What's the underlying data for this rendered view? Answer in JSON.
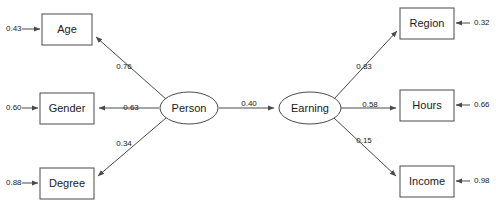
{
  "diagram": {
    "type": "structural-equation-model-path-diagram",
    "title": "",
    "background_color": "#ffffff",
    "line_color": "#4a4a4a",
    "text_color": "#1a1a1a",
    "latent_variables": [
      {
        "id": "person",
        "label": "Person",
        "shape": "ellipse",
        "cx": 189,
        "cy": 108,
        "rx": 29,
        "ry": 16
      },
      {
        "id": "earning",
        "label": "Earning",
        "shape": "ellipse",
        "cx": 310,
        "cy": 108,
        "rx": 31,
        "ry": 16
      }
    ],
    "observed_variables": [
      {
        "id": "age",
        "label": "Age",
        "shape": "rect",
        "x": 42,
        "y": 14,
        "w": 50,
        "h": 31,
        "residual": "0.43",
        "residual_x": 6,
        "residual_y": 29,
        "side": "left"
      },
      {
        "id": "gender",
        "label": "Gender",
        "shape": "rect",
        "x": 40,
        "y": 93,
        "w": 54,
        "h": 31,
        "residual": "0.60",
        "residual_x": 6,
        "residual_y": 108,
        "side": "left"
      },
      {
        "id": "degree",
        "label": "Degree",
        "shape": "rect",
        "x": 40,
        "y": 168,
        "w": 54,
        "h": 31,
        "residual": "0.88",
        "residual_x": 6,
        "residual_y": 183,
        "side": "left"
      },
      {
        "id": "region",
        "label": "Region",
        "shape": "rect",
        "x": 400,
        "y": 8,
        "w": 54,
        "h": 31,
        "residual": "0.32",
        "residual_x": 474,
        "residual_y": 23,
        "side": "right"
      },
      {
        "id": "hours",
        "label": "Hours",
        "shape": "rect",
        "x": 400,
        "y": 90,
        "w": 54,
        "h": 31,
        "residual": "0.66",
        "residual_x": 474,
        "residual_y": 105,
        "side": "right"
      },
      {
        "id": "income",
        "label": "Income",
        "shape": "rect",
        "x": 400,
        "y": 166,
        "w": 54,
        "h": 31,
        "residual": "0.98",
        "residual_x": 474,
        "residual_y": 181,
        "side": "right"
      }
    ],
    "paths": [
      {
        "id": "person-age",
        "from": "person",
        "to": "age",
        "coefficient": "0.76",
        "label_x": 124,
        "label_y": 67,
        "x1": 166,
        "y1": 99,
        "x2": 96,
        "y2": 37
      },
      {
        "id": "person-gender",
        "from": "person",
        "to": "gender",
        "coefficient": "0.63",
        "label_x": 131,
        "label_y": 108,
        "x1": 159,
        "y1": 108,
        "x2": 99,
        "y2": 108
      },
      {
        "id": "person-degree",
        "from": "person",
        "to": "degree",
        "coefficient": "0.34",
        "label_x": 124,
        "label_y": 144,
        "x1": 166,
        "y1": 118,
        "x2": 98,
        "y2": 176
      },
      {
        "id": "person-earning",
        "from": "person",
        "to": "earning",
        "coefficient": "0.40",
        "label_x": 249,
        "label_y": 104,
        "x1": 219,
        "y1": 108,
        "x2": 274,
        "y2": 108
      },
      {
        "id": "earning-region",
        "from": "earning",
        "to": "region",
        "coefficient": "0.83",
        "label_x": 364,
        "label_y": 67,
        "x1": 334,
        "y1": 99,
        "x2": 397,
        "y2": 31
      },
      {
        "id": "earning-hours",
        "from": "earning",
        "to": "hours",
        "coefficient": "0.58",
        "label_x": 370,
        "label_y": 105,
        "x1": 341,
        "y1": 108,
        "x2": 396,
        "y2": 108
      },
      {
        "id": "earning-income",
        "from": "earning",
        "to": "income",
        "coefficient": "0.15",
        "label_x": 364,
        "label_y": 141,
        "x1": 334,
        "y1": 118,
        "x2": 396,
        "y2": 176
      }
    ],
    "residual_arrows": [
      {
        "id": "resid-age",
        "x1": 22,
        "y1": 29,
        "x2": 40,
        "y2": 29
      },
      {
        "id": "resid-gender",
        "x1": 22,
        "y1": 108,
        "x2": 38,
        "y2": 108
      },
      {
        "id": "resid-degree",
        "x1": 22,
        "y1": 183,
        "x2": 38,
        "y2": 183
      },
      {
        "id": "resid-region",
        "x1": 470,
        "y1": 23,
        "x2": 456,
        "y2": 23
      },
      {
        "id": "resid-hours",
        "x1": 470,
        "y1": 105,
        "x2": 456,
        "y2": 105
      },
      {
        "id": "resid-income",
        "x1": 470,
        "y1": 181,
        "x2": 456,
        "y2": 181
      }
    ]
  }
}
